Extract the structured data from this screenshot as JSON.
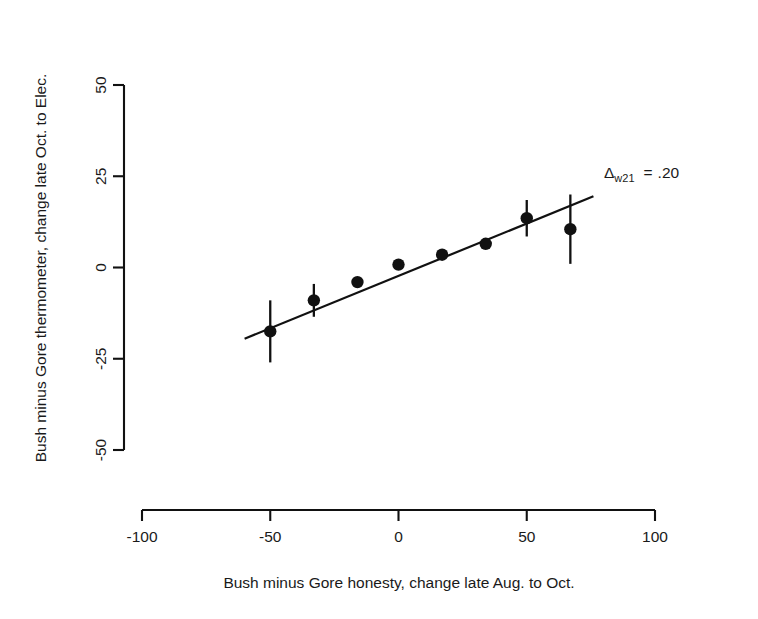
{
  "chart_data": {
    "type": "scatter",
    "title": "",
    "xlabel": "Bush minus Gore honesty, change late Aug. to Oct.",
    "ylabel": "Bush minus Gore thermometer, change late Oct. to Elec.",
    "xlim": [
      -100,
      100
    ],
    "ylim": [
      -50,
      50
    ],
    "xticks": [
      -100,
      -50,
      0,
      50,
      100
    ],
    "yticks": [
      -50,
      -25,
      0,
      25,
      50
    ],
    "xtick_labels": [
      "-100",
      "-50",
      "0",
      "50",
      "100"
    ],
    "ytick_labels": [
      "-50",
      "-25",
      "0",
      "25",
      "50"
    ],
    "grid": false,
    "legend": false,
    "marker": "filled-circle",
    "errorbars": "vertical",
    "points": [
      {
        "x": -50,
        "y": -17.5,
        "yerr": 8.5
      },
      {
        "x": -33,
        "y": -9.0,
        "yerr": 4.5
      },
      {
        "x": -16,
        "y": -4.0,
        "yerr": 0
      },
      {
        "x": 0,
        "y": 0.8,
        "yerr": 0
      },
      {
        "x": 17,
        "y": 3.5,
        "yerr": 0
      },
      {
        "x": 34,
        "y": 6.5,
        "yerr": 0
      },
      {
        "x": 50,
        "y": 13.5,
        "yerr": 5.0
      },
      {
        "x": 67,
        "y": 10.5,
        "yerr": 9.5
      }
    ],
    "fit_line": {
      "x_start": -60,
      "y_start": -19.5,
      "x_end": 76,
      "y_end": 19.5
    },
    "annotations": [
      {
        "name": "delta-w21-annotation",
        "symbol": "Δ",
        "subscript": "w21",
        "equals": "=",
        "value": ".20",
        "x": 604,
        "y": 178
      }
    ]
  },
  "axis_labels": {
    "x_title": "Bush minus Gore honesty, change late Aug. to Oct.",
    "y_title": "Bush minus Gore thermometer, change late Oct. to Elec."
  },
  "colors": {
    "foreground": "#111111",
    "background": "#ffffff",
    "text": "#1a1a1a"
  }
}
